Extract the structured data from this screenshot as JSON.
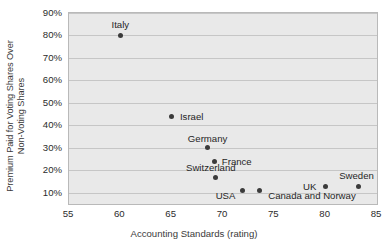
{
  "chart_data": {
    "type": "scatter",
    "title": "",
    "xlabel": "Accounting Standards (rating)",
    "ylabel_line1": "Premium Paid for Voting Shares Over",
    "ylabel_line2": "Non-Voting Shares",
    "xlim": [
      55,
      85
    ],
    "ylim": [
      5,
      90
    ],
    "xticks": [
      55,
      60,
      65,
      70,
      75,
      80,
      85
    ],
    "xtick_labels": [
      "55",
      "60",
      "65",
      "70",
      "75",
      "80",
      "85"
    ],
    "yticks": [
      10,
      20,
      30,
      40,
      50,
      60,
      70,
      80,
      90
    ],
    "ytick_labels": [
      "10%",
      "20%",
      "30%",
      "40%",
      "50%",
      "60%",
      "70%",
      "80%",
      "90%"
    ],
    "grid": "horizontal",
    "legend": "none",
    "points": [
      {
        "label": "Italy",
        "x": 60.0,
        "y": 80,
        "label_dx": 0,
        "label_dy": -11
      },
      {
        "label": "Israel",
        "x": 65.0,
        "y": 44,
        "label_dx": 20,
        "label_dy": 0
      },
      {
        "label": "Germany",
        "x": 68.5,
        "y": 30,
        "label_dx": 0,
        "label_dy": -10
      },
      {
        "label": "France",
        "x": 69.2,
        "y": 24,
        "label_dx": 22,
        "label_dy": 0
      },
      {
        "label": "Switzerland",
        "x": 69.3,
        "y": 17,
        "label_dx": -5,
        "label_dy": -10
      },
      {
        "label": "USA",
        "x": 71.9,
        "y": 11,
        "label_dx": -17,
        "label_dy": 4
      },
      {
        "label": "Canada and Norway",
        "x": 73.6,
        "y": 11,
        "label_dx": 52,
        "label_dy": 4
      },
      {
        "label": "UK",
        "x": 80.0,
        "y": 13,
        "label_dx": -16,
        "label_dy": 0
      },
      {
        "label": "Sweden",
        "x": 83.2,
        "y": 13,
        "label_dx": -2,
        "label_dy": -11
      }
    ],
    "colors": {
      "plot_background": "#e9e9e9",
      "plot_border": "#b9b9b9",
      "gridline": "#c6c6c6",
      "marker": "#3b3b3b",
      "text": "#262626"
    }
  }
}
